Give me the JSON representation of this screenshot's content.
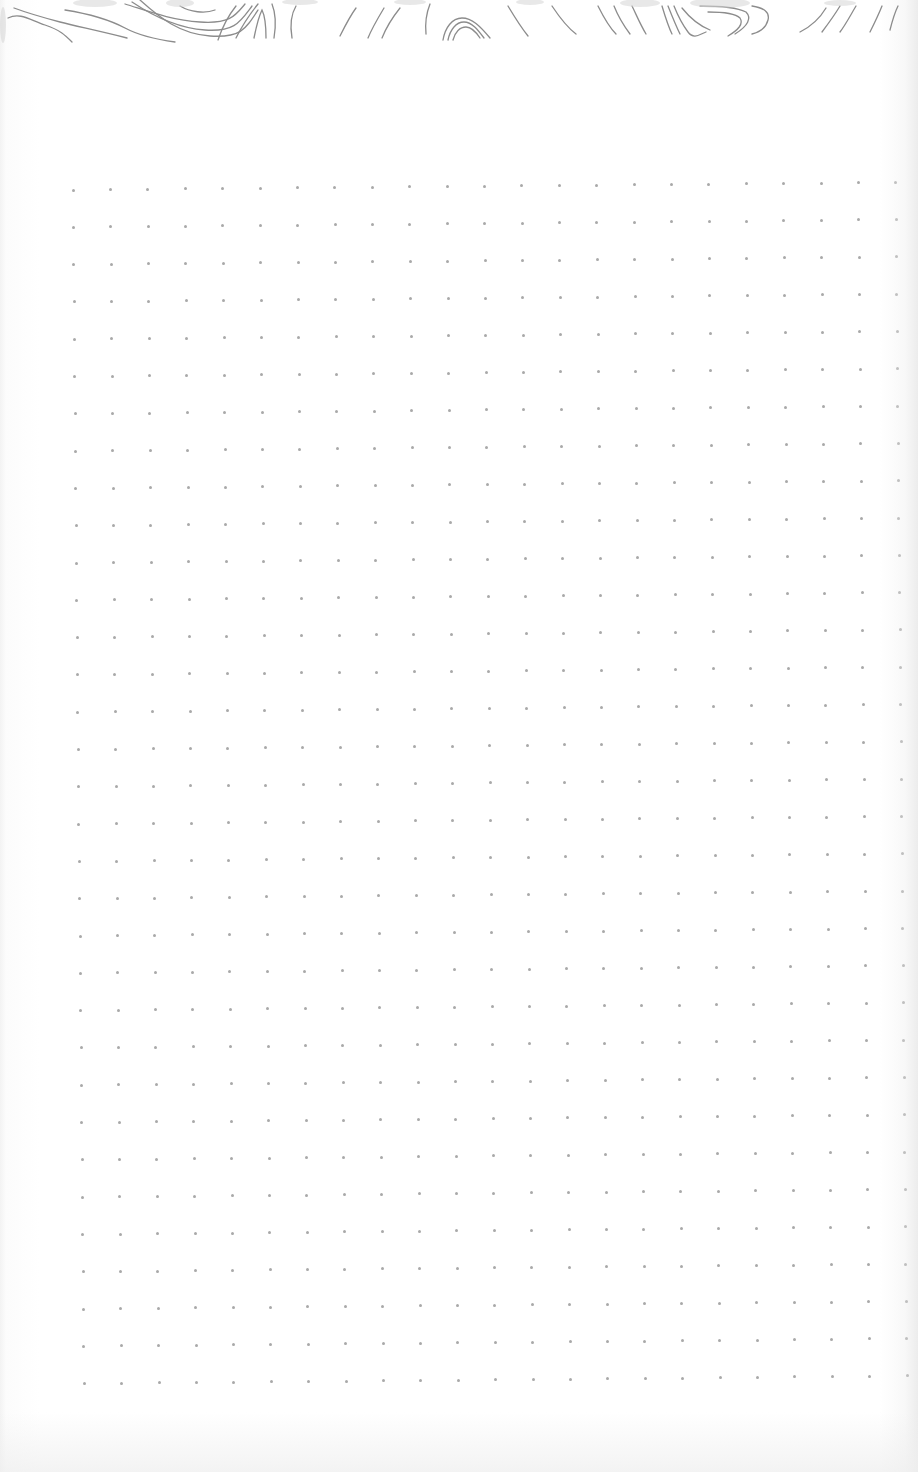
{
  "page": {
    "type": "dot-grid-notebook-page",
    "background_color": "#ffffff",
    "header": {
      "pattern": "wood-grain-contour-lines",
      "line_color": "#8a8a8a",
      "height_px": 45
    },
    "dot_grid": {
      "columns": 23,
      "rows": 33,
      "origin_x": 73,
      "origin_y": 190,
      "spacing_x": 37.4,
      "spacing_y": 37.3,
      "dot_color": "#9a9a9a",
      "dot_size_px": 3
    }
  }
}
